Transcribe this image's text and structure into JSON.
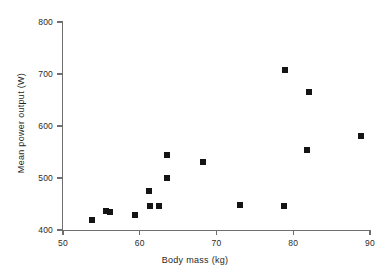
{
  "chart_data": {
    "type": "scatter",
    "title": "",
    "xlabel": "Body mass (kg)",
    "ylabel": "Mean power output (W)",
    "xlim": [
      50,
      90
    ],
    "ylim": [
      400,
      800
    ],
    "xticks": [
      50,
      60,
      70,
      80,
      90
    ],
    "yticks": [
      400,
      500,
      600,
      700,
      800
    ],
    "xtick_labels": [
      "50",
      "60",
      "70",
      "80",
      "90"
    ],
    "ytick_labels": [
      "400",
      "500",
      "600",
      "700",
      "800"
    ],
    "grid": false,
    "legend": null,
    "marker": "square",
    "marker_color": "#141414",
    "axis_color": "#6f6f6f",
    "points": [
      {
        "x": 53.8,
        "y": 419
      },
      {
        "x": 55.6,
        "y": 437
      },
      {
        "x": 56.1,
        "y": 434
      },
      {
        "x": 59.4,
        "y": 428
      },
      {
        "x": 61.2,
        "y": 475
      },
      {
        "x": 61.4,
        "y": 446
      },
      {
        "x": 62.5,
        "y": 447
      },
      {
        "x": 63.5,
        "y": 544
      },
      {
        "x": 63.6,
        "y": 500
      },
      {
        "x": 68.3,
        "y": 531
      },
      {
        "x": 73.1,
        "y": 448
      },
      {
        "x": 78.8,
        "y": 446
      },
      {
        "x": 78.9,
        "y": 707
      },
      {
        "x": 81.8,
        "y": 553
      },
      {
        "x": 82.0,
        "y": 665
      },
      {
        "x": 88.8,
        "y": 581
      }
    ]
  }
}
